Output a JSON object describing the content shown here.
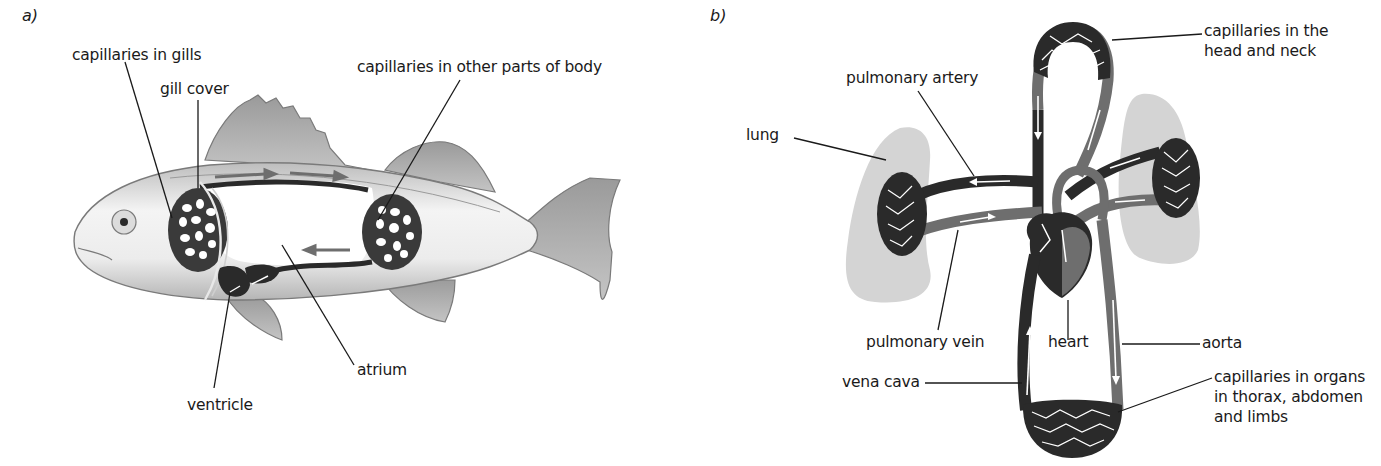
{
  "figure": {
    "panel_a": {
      "letter": "a)",
      "labels": {
        "capillaries_gills": "capillaries in gills",
        "gill_cover": "gill cover",
        "capillaries_body": "capillaries in other parts of body",
        "ventricle": "ventricle",
        "atrium": "atrium"
      }
    },
    "panel_b": {
      "letter": "b)",
      "labels": {
        "pulmonary_artery": "pulmonary artery",
        "lung": "lung",
        "capillaries_head_line1": "capillaries in the",
        "capillaries_head_line2": "head and neck",
        "pulmonary_vein": "pulmonary vein",
        "heart": "heart",
        "aorta": "aorta",
        "vena_cava": "vena cava",
        "capillaries_organs_line1": "capillaries in organs",
        "capillaries_organs_line2": "in thorax, abdomen",
        "capillaries_organs_line3": "and limbs"
      }
    },
    "colors": {
      "deoxygenated": "#2a2a2a",
      "oxygenated": "#6e6e6e",
      "lung_fill": "#d4d4d4",
      "fish_body": "#e6e6e6",
      "fin": "#a8a8a8",
      "leader_line": "#1a1a1a"
    }
  }
}
